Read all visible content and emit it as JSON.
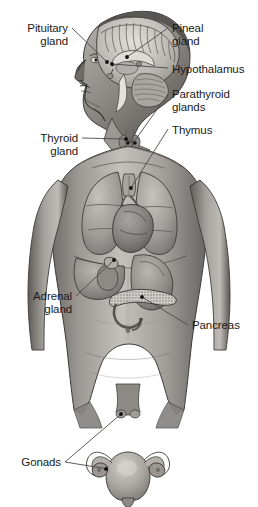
{
  "figure": {
    "width": 258,
    "height": 507,
    "background_color": "#ffffff",
    "style": "grayscale halftone medical illustration"
  },
  "colors": {
    "background": "#ffffff",
    "label_text": "#1a1a1a",
    "leader_line": "#4a4a4a",
    "marker_dot": "#111111",
    "skin_light": "#c9c6c2",
    "skin_mid": "#9c9894",
    "skin_dark": "#6d6a67",
    "skin_shadow": "#4a4846",
    "organ_light": "#bdbab6",
    "organ_mid": "#95918d",
    "organ_dark": "#6a6764",
    "brain_light": "#d6d3cf",
    "brain_mid": "#a8a5a1",
    "outline": "#3a3836"
  },
  "labels": [
    {
      "id": "pituitary-gland",
      "text": "Pituitary\ngland",
      "lines": [
        "Pituitary",
        "gland"
      ],
      "align": "right",
      "text_x": 68,
      "text_y": 22,
      "leader_from_x": 72,
      "leader_from_y": 28,
      "marker_x": 107,
      "marker_y": 62,
      "side": "left"
    },
    {
      "id": "pineal-gland",
      "text": "Pineal\ngland",
      "lines": [
        "Pineal",
        "gland"
      ],
      "align": "left",
      "text_x": 172,
      "text_y": 22,
      "leader_from_x": 168,
      "leader_from_y": 28,
      "marker_x": 127,
      "marker_y": 57,
      "side": "right"
    },
    {
      "id": "hypothalamus",
      "text": "Hypothalamus",
      "lines": [
        "Hypothalamus"
      ],
      "align": "left",
      "text_x": 172,
      "text_y": 63,
      "leader_from_x": 168,
      "leader_from_y": 68,
      "marker_x": 112,
      "marker_y": 64,
      "side": "right"
    },
    {
      "id": "parathyroid-glands",
      "text": "Parathyroid\nglands",
      "lines": [
        "Parathyroid",
        "glands"
      ],
      "align": "left",
      "text_x": 172,
      "text_y": 88,
      "leader_from_x": 168,
      "leader_from_y": 94,
      "marker_x": 131,
      "marker_y": 146,
      "side": "right"
    },
    {
      "id": "thymus",
      "text": "Thymus",
      "lines": [
        "Thymus"
      ],
      "align": "left",
      "text_x": 172,
      "text_y": 124,
      "leader_from_x": 168,
      "leader_from_y": 129,
      "marker_x": 131,
      "marker_y": 188,
      "side": "right"
    },
    {
      "id": "thyroid-gland",
      "text": "Thyroid\ngland",
      "lines": [
        "Thyroid",
        "gland"
      ],
      "align": "right",
      "text_x": 78,
      "text_y": 132,
      "leader_from_x": 82,
      "leader_from_y": 138,
      "marker_x": 126,
      "marker_y": 139,
      "side": "left"
    },
    {
      "id": "adrenal-gland",
      "text": "Adrenal\ngland",
      "lines": [
        "Adrenal",
        "gland"
      ],
      "align": "right",
      "text_x": 72,
      "text_y": 290,
      "leader_from_x": 76,
      "leader_from_y": 296,
      "marker_x": 114,
      "marker_y": 260,
      "side": "left"
    },
    {
      "id": "pancreas",
      "text": "Pancreas",
      "lines": [
        "Pancreas"
      ],
      "align": "left",
      "text_x": 192,
      "text_y": 319,
      "leader_from_x": 188,
      "leader_from_y": 325,
      "marker_x": 142,
      "marker_y": 297,
      "side": "right"
    },
    {
      "id": "gonads",
      "text": "Gonads",
      "lines": [
        "Gonads"
      ],
      "align": "right",
      "text_x": 61,
      "text_y": 456,
      "leader_from_x": 65,
      "leader_from_y": 462,
      "marker_x": 121,
      "marker_y": 414,
      "marker2_x": 110,
      "marker2_y": 468,
      "side": "left"
    }
  ],
  "anatomy_parts": [
    {
      "id": "head",
      "name": "Head in left profile with sagittal brain cross-section"
    },
    {
      "id": "cerebrum",
      "name": "Cerebrum with gyri"
    },
    {
      "id": "corpus-callosum",
      "name": "Corpus callosum"
    },
    {
      "id": "cerebellum",
      "name": "Cerebellum"
    },
    {
      "id": "brainstem",
      "name": "Brainstem"
    },
    {
      "id": "neck",
      "name": "Neck with trachea"
    },
    {
      "id": "trachea",
      "name": "Trachea"
    },
    {
      "id": "left-lung",
      "name": "Left lung"
    },
    {
      "id": "right-lung",
      "name": "Right lung"
    },
    {
      "id": "heart",
      "name": "Heart"
    },
    {
      "id": "thymus-organ",
      "name": "Thymus"
    },
    {
      "id": "liver",
      "name": "Liver"
    },
    {
      "id": "stomach",
      "name": "Stomach"
    },
    {
      "id": "kidney",
      "name": "Kidney"
    },
    {
      "id": "adrenal-organ",
      "name": "Adrenal gland atop kidney"
    },
    {
      "id": "pancreas-organ",
      "name": "Pancreas"
    },
    {
      "id": "intestines",
      "name": "Intestines"
    },
    {
      "id": "torso",
      "name": "Male torso with arms at sides"
    },
    {
      "id": "uterus-inset",
      "name": "Uterus with fallopian tubes and ovaries (inset below body)"
    }
  ]
}
